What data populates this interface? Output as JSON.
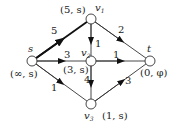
{
  "graph": {
    "type": "directed weighted network (Dijkstra labeling)",
    "nodes": [
      {
        "id": "s",
        "name": "s",
        "label": "(∞, s)",
        "x": 32,
        "y": 61
      },
      {
        "id": "v1",
        "name": "v1",
        "label": "(5, s)",
        "x": 91,
        "y": 19
      },
      {
        "id": "v2",
        "name": "v2",
        "label": "(3, s)",
        "x": 91,
        "y": 61
      },
      {
        "id": "t",
        "name": "t",
        "label": "(0, φ)",
        "x": 150,
        "y": 61
      },
      {
        "id": "v3",
        "name": "v3",
        "label": "(1, s)",
        "x": 91,
        "y": 104
      }
    ],
    "edges": [
      {
        "from": "s",
        "to": "v1",
        "weight": "5",
        "bold": true
      },
      {
        "from": "s",
        "to": "v2",
        "weight": "3",
        "bold": false
      },
      {
        "from": "s",
        "to": "v3",
        "weight": "1",
        "bold": false
      },
      {
        "from": "v1",
        "to": "v2",
        "weight": "1",
        "bold": false
      },
      {
        "from": "v1",
        "to": "t",
        "weight": "2",
        "bold": false
      },
      {
        "from": "v2",
        "to": "t",
        "weight": "1",
        "bold": false
      },
      {
        "from": "v2",
        "to": "v3",
        "weight": "4",
        "bold": false
      },
      {
        "from": "v3",
        "to": "t",
        "weight": "3",
        "bold": false
      }
    ]
  },
  "labels": {
    "s_name": "s",
    "s_tag": "(∞, s)",
    "v1_name": "v",
    "v1_sub": "1",
    "v1_tag": "(5, s)",
    "v2_name": "v",
    "v2_sub": "2",
    "v2_tag": "(3, s)",
    "t_name": "t",
    "t_tag": "(0, φ)",
    "v3_name": "v",
    "v3_sub": "3",
    "v3_tag": "(1, s)",
    "w_s_v1": "5",
    "w_s_v2": "3",
    "w_s_v3": "1",
    "w_v1_v2": "1",
    "w_v1_t": "2",
    "w_v2_t": "1",
    "w_v2_v3": "4",
    "w_v3_t": "3"
  }
}
